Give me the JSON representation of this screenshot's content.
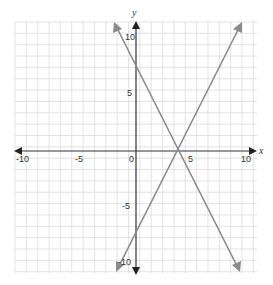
{
  "chart_data": {
    "type": "line",
    "title": "",
    "xlabel": "x",
    "ylabel": "y",
    "xlim": [
      -10,
      10
    ],
    "ylim": [
      -10,
      10
    ],
    "grid": true,
    "x_ticks": [
      "-10",
      "-5",
      "0",
      "5",
      "10"
    ],
    "y_ticks": [
      "10",
      "5",
      "-5",
      "-10"
    ],
    "series": [
      {
        "name": "line-decreasing",
        "equation": "y = -2x + 8",
        "points": [
          [
            -1,
            10
          ],
          [
            9,
            -10
          ]
        ]
      },
      {
        "name": "line-increasing",
        "equation": "y = 2x - 7",
        "points": [
          [
            -1.5,
            -10
          ],
          [
            8.5,
            10
          ]
        ]
      }
    ],
    "intersection": [
      3.75,
      0.5
    ]
  },
  "labels": {
    "x_axis": "x",
    "y_axis": "y",
    "xt_m10": "-10",
    "xt_m5": "-5",
    "xt_0": "0",
    "xt_5": "5",
    "xt_10": "10",
    "yt_10": "10",
    "yt_5": "5",
    "yt_m5": "-5",
    "yt_m10": "-10"
  },
  "colors": {
    "grid": "#dddddd",
    "axis": "#333333",
    "line": "#888888"
  }
}
